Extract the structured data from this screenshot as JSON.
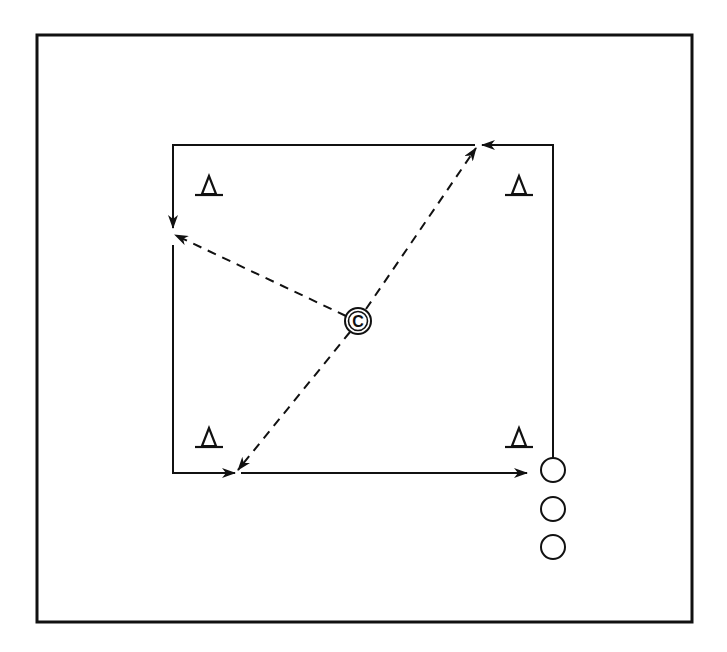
{
  "diagram": {
    "type": "drill-diagram",
    "colors": {
      "stroke": "#111111",
      "background": "#ffffff"
    },
    "coach": {
      "label": "C",
      "x": 358,
      "y": 321,
      "r": 13
    },
    "cones": [
      {
        "name": "cone-top-left",
        "x": 209,
        "y": 186
      },
      {
        "name": "cone-top-right",
        "x": 519,
        "y": 186
      },
      {
        "name": "cone-bottom-left",
        "x": 209,
        "y": 440
      },
      {
        "name": "cone-bottom-right",
        "x": 519,
        "y": 440
      }
    ],
    "players": [
      {
        "name": "player-1",
        "x": 553,
        "y": 470,
        "r": 12
      },
      {
        "name": "player-2",
        "x": 553,
        "y": 509,
        "r": 12
      },
      {
        "name": "player-3",
        "x": 553,
        "y": 547,
        "r": 12
      }
    ],
    "run_path_description": "Player runs counter-clockwise around square; coach passes to corners (dashed)",
    "pass_targets": [
      "top-right",
      "top-left",
      "bottom-left"
    ]
  }
}
